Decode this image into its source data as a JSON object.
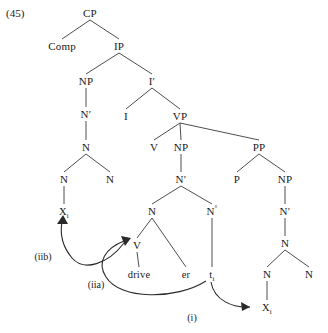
{
  "figure": {
    "example_number": "(45)",
    "type": "syntactic-tree-diagram",
    "nodes": [
      {
        "id": "cp",
        "label": "CP",
        "x": 90,
        "y": 13
      },
      {
        "id": "comp",
        "label": "Comp",
        "x": 62,
        "y": 46
      },
      {
        "id": "ip",
        "label": "IP",
        "x": 119,
        "y": 46
      },
      {
        "id": "np1",
        "label": "NP",
        "x": 86,
        "y": 81
      },
      {
        "id": "ibar",
        "label": "I′",
        "x": 152,
        "y": 81
      },
      {
        "id": "nbar1",
        "label": "N′",
        "x": 86,
        "y": 114
      },
      {
        "id": "i",
        "label": "I",
        "x": 126,
        "y": 116
      },
      {
        "id": "vp",
        "label": "VP",
        "x": 180,
        "y": 116
      },
      {
        "id": "n1",
        "label": "N",
        "x": 86,
        "y": 147
      },
      {
        "id": "v1",
        "label": "V",
        "x": 154,
        "y": 147
      },
      {
        "id": "np2",
        "label": "NP",
        "x": 181,
        "y": 147
      },
      {
        "id": "pp",
        "label": "PP",
        "x": 259,
        "y": 147
      },
      {
        "id": "n2",
        "label": "N",
        "x": 64,
        "y": 179
      },
      {
        "id": "n3",
        "label": "N",
        "x": 110,
        "y": 179
      },
      {
        "id": "nbar2",
        "label": "N′",
        "x": 181,
        "y": 179
      },
      {
        "id": "p",
        "label": "P",
        "x": 237,
        "y": 179
      },
      {
        "id": "np3",
        "label": "NP",
        "x": 285,
        "y": 179
      },
      {
        "id": "x1",
        "label": "X",
        "sub": "i",
        "x": 64,
        "y": 211,
        "lex": true
      },
      {
        "id": "n4",
        "label": "N",
        "x": 152,
        "y": 211
      },
      {
        "id": "n5",
        "label": "N",
        "sup": "°",
        "x": 212,
        "y": 211
      },
      {
        "id": "nbar3",
        "label": "N′",
        "x": 285,
        "y": 211
      },
      {
        "id": "v2",
        "label": "V",
        "x": 137,
        "y": 245
      },
      {
        "id": "n6",
        "label": "N",
        "x": 285,
        "y": 243
      },
      {
        "id": "drive",
        "label": "drive",
        "x": 139,
        "y": 274,
        "lex": true
      },
      {
        "id": "er",
        "label": "er",
        "x": 186,
        "y": 274,
        "lex": true
      },
      {
        "id": "t1",
        "label": "t",
        "sub": "i",
        "x": 212,
        "y": 274,
        "lex": true
      },
      {
        "id": "n7",
        "label": "N",
        "x": 267,
        "y": 274
      },
      {
        "id": "n8",
        "label": "N",
        "x": 309,
        "y": 274
      },
      {
        "id": "x2",
        "label": "X",
        "sub": "i",
        "x": 267,
        "y": 307,
        "lex": true
      }
    ],
    "edges": [
      {
        "from": "cp",
        "to": "comp"
      },
      {
        "from": "cp",
        "to": "ip"
      },
      {
        "from": "ip",
        "to": "np1"
      },
      {
        "from": "ip",
        "to": "ibar"
      },
      {
        "from": "np1",
        "to": "nbar1"
      },
      {
        "from": "nbar1",
        "to": "n1"
      },
      {
        "from": "ibar",
        "to": "i"
      },
      {
        "from": "ibar",
        "to": "vp"
      },
      {
        "from": "n1",
        "to": "n2"
      },
      {
        "from": "n1",
        "to": "n3"
      },
      {
        "from": "vp",
        "to": "v1"
      },
      {
        "from": "vp",
        "to": "np2"
      },
      {
        "from": "vp",
        "to": "pp"
      },
      {
        "from": "np2",
        "to": "nbar2"
      },
      {
        "from": "pp",
        "to": "p"
      },
      {
        "from": "pp",
        "to": "np3"
      },
      {
        "from": "n2",
        "to": "x1"
      },
      {
        "from": "nbar2",
        "to": "n4"
      },
      {
        "from": "nbar2",
        "to": "n5"
      },
      {
        "from": "np3",
        "to": "nbar3"
      },
      {
        "from": "n4",
        "to": "v2"
      },
      {
        "from": "n4",
        "to": "er"
      },
      {
        "from": "n5",
        "to": "t1"
      },
      {
        "from": "nbar3",
        "to": "n6"
      },
      {
        "from": "v2",
        "to": "drive"
      },
      {
        "from": "n6",
        "to": "n7"
      },
      {
        "from": "n6",
        "to": "n8"
      },
      {
        "from": "n7",
        "to": "x2"
      }
    ],
    "movements": [
      {
        "id": "move-i",
        "label": "(i)",
        "label_x": 192,
        "label_y": 318,
        "from": "t1",
        "to": "x2"
      },
      {
        "id": "move-iia",
        "label": "(iia)",
        "label_x": 96,
        "label_y": 285,
        "from": "t1",
        "to": "v2"
      },
      {
        "id": "move-iib",
        "label": "(iib)",
        "label_x": 43,
        "label_y": 257,
        "from": "v2",
        "to": "x1"
      }
    ]
  }
}
